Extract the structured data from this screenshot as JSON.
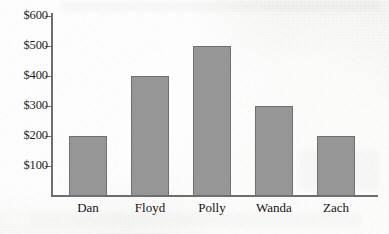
{
  "chart_data": {
    "type": "bar",
    "title": "",
    "subtitle": "",
    "xlabel": "",
    "ylabel": "",
    "categories": [
      "Dan",
      "Floyd",
      "Polly",
      "Wanda",
      "Zach"
    ],
    "values": [
      200,
      400,
      500,
      300,
      200
    ],
    "value_prefix": "$",
    "ylim": [
      0,
      620
    ],
    "ytick_values": [
      100,
      200,
      300,
      400,
      500,
      600
    ],
    "ytick_labels": [
      "$100",
      "$200",
      "$300",
      "$400",
      "$500",
      "$600"
    ],
    "grid": false,
    "legend": false,
    "legend_position": "none",
    "bar_color": "#969696",
    "bar_edge_color": "#6f6f6f",
    "axis_color": "#6d6d6d",
    "background_color": "#f4f4f2",
    "text_color": "#141414"
  },
  "figure": {
    "name": "bar-chart"
  }
}
